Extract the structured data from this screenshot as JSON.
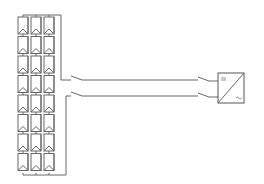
{
  "diagram": {
    "colors": {
      "line": "#555555",
      "background": "#ffffff"
    },
    "pv_array": {
      "columns": 3,
      "rows": 8,
      "module_icon": "pv-module-icon"
    },
    "dc_disconnect": {
      "poles": 2,
      "icon": "switch-icon"
    },
    "ac_disconnect": {
      "poles": 2,
      "icon": "switch-icon"
    },
    "inverter": {
      "icon": "inverter-icon",
      "dc_symbol": "⎓",
      "ac_symbol": "~"
    }
  }
}
